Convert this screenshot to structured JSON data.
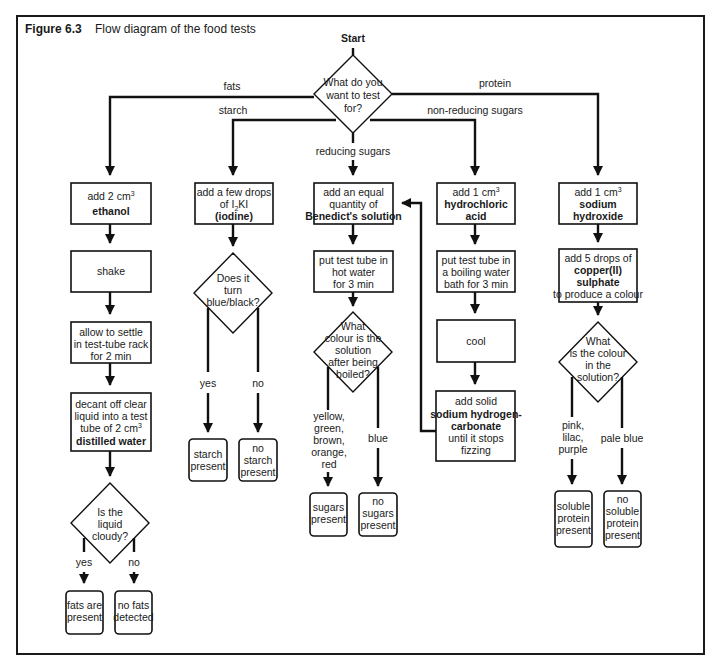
{
  "figure": {
    "number": "Figure 6.3",
    "title": "Flow diagram of the food tests"
  },
  "start": {
    "label": "Start",
    "question": [
      "What do you",
      "want to test",
      "for?"
    ]
  },
  "branches": {
    "fats": "fats",
    "starch": "starch",
    "reducing_sugars": "reducing sugars",
    "non_reducing_sugars": "non-reducing sugars",
    "protein": "protein"
  },
  "fats_test": {
    "step1": {
      "line1": "add 2 cm",
      "sup": "3",
      "bold": "ethanol"
    },
    "step2": "shake",
    "step3": [
      "allow to settle",
      "in test-tube rack",
      "for 2 min"
    ],
    "step4": {
      "lines": [
        "decant off clear",
        "liquid into a test"
      ],
      "line3": "tube of 2 cm",
      "sup": "3",
      "bold": "distilled water"
    },
    "question": [
      "Is the",
      "liquid",
      "cloudy?"
    ],
    "yes_label": "yes",
    "no_label": "no",
    "yes_result": [
      "fats are",
      "present"
    ],
    "no_result": [
      "no fats",
      "detected"
    ]
  },
  "starch_test": {
    "step1": {
      "lines": [
        "add a few drops"
      ],
      "iodide": "of I",
      "sub": "2",
      "kI": "KI",
      "bold": "(iodine)"
    },
    "question": [
      "Does it",
      "turn",
      "blue/black?"
    ],
    "yes_label": "yes",
    "no_label": "no",
    "yes_result": [
      "starch",
      "present"
    ],
    "no_result": [
      "no",
      "starch",
      "present"
    ]
  },
  "reducing_test": {
    "step1": {
      "lines": [
        "add an equal",
        "quantity of"
      ],
      "bold": "Benedict's solution"
    },
    "step2": [
      "put test tube in",
      "hot water",
      "for 3 min"
    ],
    "question": [
      "What",
      "colour is the",
      "solution",
      "after being",
      "boiled?"
    ],
    "positive_label": [
      "yellow,",
      "green,",
      "brown,",
      "orange,",
      "red"
    ],
    "negative_label": "blue",
    "positive_result": [
      "sugars",
      "present"
    ],
    "negative_result": [
      "no",
      "sugars",
      "present"
    ]
  },
  "non_reducing_test": {
    "step1": {
      "line1": "add 1 cm",
      "sup": "3",
      "bold": [
        "hydrochloric",
        "acid"
      ]
    },
    "step2": [
      "put test tube in",
      "a boiling water",
      "bath for 3 min"
    ],
    "step3": "cool",
    "step4": {
      "line1": "add solid",
      "bold": [
        "sodium hydrogen-",
        "carbonate"
      ],
      "lines": [
        "until it stops",
        "fizzing"
      ]
    }
  },
  "protein_test": {
    "step1": {
      "line1": "add 1 cm",
      "sup": "3",
      "bold": [
        "sodium",
        "hydroxide"
      ]
    },
    "step2": {
      "line1": "add 5 drops of",
      "bold": [
        "copper(II)",
        "sulphate"
      ],
      "line_end": "to produce a colour"
    },
    "question": [
      "What",
      "is the colour",
      "in the",
      "solution?"
    ],
    "positive_label": [
      "pink,",
      "lilac,",
      "purple"
    ],
    "negative_label": "pale blue",
    "positive_result": [
      "soluble",
      "protein",
      "present"
    ],
    "negative_result": [
      "no",
      "soluble",
      "protein",
      "present"
    ]
  }
}
